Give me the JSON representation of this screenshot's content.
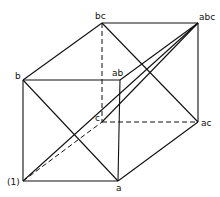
{
  "diagram": {
    "type": "factorial-design-cube",
    "vertices": {
      "one": {
        "label": "(1)",
        "x": 23,
        "y": 181
      },
      "a": {
        "label": "a",
        "x": 118,
        "y": 181
      },
      "b": {
        "label": "b",
        "x": 23,
        "y": 80
      },
      "ab": {
        "label": "ab",
        "x": 120,
        "y": 80
      },
      "c": {
        "label": "c",
        "x": 102,
        "y": 122
      },
      "ac": {
        "label": "ac",
        "x": 198,
        "y": 122
      },
      "bc": {
        "label": "bc",
        "x": 102,
        "y": 23
      },
      "abc": {
        "label": "abc",
        "x": 198,
        "y": 23
      }
    },
    "solid_edges": [
      [
        "one",
        "a"
      ],
      [
        "one",
        "b"
      ],
      [
        "b",
        "ab"
      ],
      [
        "ab",
        "a"
      ],
      [
        "b",
        "bc"
      ],
      [
        "bc",
        "abc"
      ],
      [
        "ab",
        "abc"
      ],
      [
        "abc",
        "ac"
      ],
      [
        "a",
        "ac"
      ],
      [
        "b",
        "a"
      ],
      [
        "bc",
        "ac"
      ],
      [
        "one",
        "abc"
      ],
      [
        "c",
        "abc"
      ]
    ],
    "dashed_edges": [
      [
        "bc",
        "c"
      ],
      [
        "c",
        "ac"
      ],
      [
        "one",
        "c"
      ]
    ],
    "line_color": "#111111"
  }
}
